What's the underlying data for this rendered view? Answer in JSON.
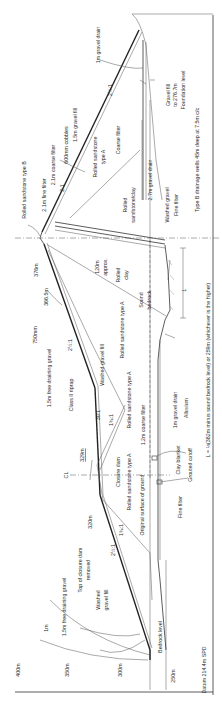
{
  "diagram": {
    "type": "dam-cross-section",
    "orientation": "rotated 90 degrees clockwise",
    "datum": "Datum 214.4m SPD",
    "elevation_scale": [
      "400m",
      "350m",
      "300m",
      "250m"
    ],
    "levels": {
      "crest": "376m",
      "berm": "366.5m",
      "closure_top": "329m",
      "closure_upstream": "320m",
      "bedrock_level": "Bedrock level",
      "foundation_level": "Foundation level",
      "centerline": "CL"
    },
    "slopes": {
      "upstream_upper": "2½:1",
      "upstream_berm": "30:1",
      "upstream_lower": "2½:1",
      "closure_upstream": "1¾:1",
      "closure_downstream": "1¾:1",
      "downstream_upper": "2:1",
      "downstream_lower": "2½:1",
      "core_upper": "2½:1"
    },
    "labels": {
      "rolled_sandstone_b": "Rolled sandstone type B",
      "fine_filter_21": "2.1m fine filter",
      "coarse_filter_21": "2.1m coarse filter",
      "cobbles": "600mm cobbles",
      "gravel_fill_15": "1.5m gravel fill",
      "gravel_drain_1m_top": "1m gravel drain",
      "rolled_sandstone_a_top": "Rolled sandstone type A",
      "coarse_filter": "Coarse filter",
      "gravel_fill_276": "Gravel fill to 276.7m",
      "rolled_sandstone_clay": "Rolled sandstone/clay",
      "gravel_drain_27": "2.7m gravel drain",
      "washed_gravel": "Washed gravel",
      "fine_filter": "Fine filter",
      "type_b_wells": "Type B drainage wells 45m deep at 7.5m c/c",
      "approx_120": "120m approx.",
      "rolled_clay": "Rolled clay",
      "sound_bedrock": "Sound bedrock",
      "L": "L",
      "rolled_sandstone_a_mid": "Rolled sandstone type A",
      "riprap_750": "750mm",
      "free_draining_15_top": "1.5m free draining gravel",
      "class_ii_riprap": "Class II riprap",
      "washed_gravel_fill_mid": "Washed gravel fill",
      "rolled_sandstone_a_low": "Rolled sandstone type A",
      "coarse_filter_12": "1.2m coarse filter",
      "gravel_drain_1m_low": "1m gravel drain",
      "alluvium": "Alluvium",
      "clay_blanket": "Clay blanket",
      "grouted_cutoff": "Grouted cutoff",
      "closure_dam": "Closure dam",
      "original_surface": "Original surface of ground",
      "fine_filter_low": "Fine filter",
      "L_formula": "L = ⅓(382m minus sound bedrock level) or 259m (whichever is the higher)",
      "free_draining_15_low": "1.5m free draining gravel",
      "top_closure_removed_1": "Top of closure dam",
      "top_closure_removed_2": "removed",
      "washed_gravel_fill_low_1": "Washed",
      "washed_gravel_fill_low_2": "gravel fill",
      "one_m": "1m"
    }
  }
}
